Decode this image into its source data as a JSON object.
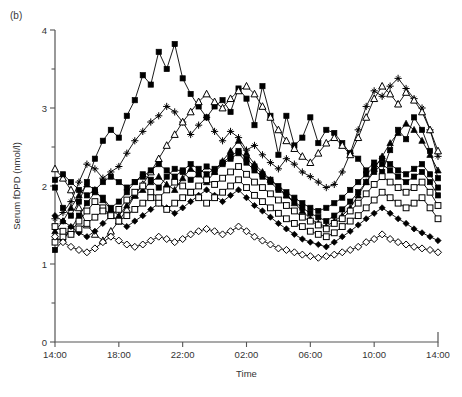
{
  "figure": {
    "panel_label": "(b)",
    "width": 462,
    "height": 397
  },
  "chart_data": {
    "type": "line",
    "title": "",
    "panel": "(b)",
    "xlabel": "Time",
    "ylabel": "Serum fDPD (nmol/l)",
    "ylim": [
      0,
      4
    ],
    "y_major_ticks": [
      0,
      1,
      2,
      3,
      4
    ],
    "y_minor_ticks": [
      0.5,
      1.5,
      2.5,
      3.5
    ],
    "y_tick_labels": [
      "0",
      "1",
      "2",
      "3",
      "4"
    ],
    "xlim_hours": [
      0,
      24
    ],
    "x_tick_labels": [
      "14:00",
      "18:00",
      "22:00",
      "02:00",
      "06:00",
      "10:00",
      "14:00"
    ],
    "x_tick_hours": [
      0,
      4,
      8,
      12,
      16,
      20,
      24
    ],
    "grid": false,
    "legend": "none",
    "x_unit": "clock time over 24 h, samples every 0.5 h",
    "x": [
      0,
      0.5,
      1,
      1.5,
      2,
      2.5,
      3,
      3.5,
      4,
      4.5,
      5,
      5.5,
      6,
      6.5,
      7,
      7.5,
      8,
      8.5,
      9,
      9.5,
      10,
      10.5,
      11,
      11.5,
      12,
      12.5,
      13,
      13.5,
      14,
      14.5,
      15,
      15.5,
      16,
      16.5,
      17,
      17.5,
      18,
      18.5,
      19,
      19.5,
      20,
      20.5,
      21,
      21.5,
      22,
      22.5,
      23,
      23.5,
      24
    ],
    "series": [
      {
        "name": "Subject 1",
        "marker": "filled-square",
        "values": [
          1.98,
          1.72,
          1.62,
          1.8,
          2.05,
          2.35,
          2.58,
          2.72,
          2.62,
          2.9,
          3.1,
          3.42,
          3.3,
          3.72,
          3.5,
          3.82,
          3.38,
          3.18,
          3.02,
          2.88,
          3.02,
          3.1,
          2.95,
          3.25,
          3.12,
          2.78,
          3.28,
          2.9,
          2.4,
          2.9,
          2.52,
          2.62,
          2.88,
          2.55,
          2.72,
          2.68,
          2.55,
          2.42,
          2.35,
          2.2,
          2.3,
          2.18,
          2.46,
          2.72,
          2.6,
          2.88,
          2.72,
          2.45,
          2.1
        ]
      },
      {
        "name": "Subject 2",
        "marker": "plus-star",
        "values": [
          1.58,
          1.66,
          1.8,
          2.05,
          2.28,
          2.22,
          2.1,
          2.18,
          2.25,
          2.42,
          2.58,
          2.7,
          2.82,
          2.9,
          3.02,
          2.95,
          2.82,
          2.66,
          2.78,
          2.88,
          2.7,
          2.58,
          2.7,
          2.62,
          2.46,
          2.52,
          2.4,
          2.3,
          2.22,
          2.35,
          2.28,
          2.18,
          2.12,
          2.05,
          1.98,
          2.02,
          2.18,
          2.42,
          2.72,
          3.02,
          3.22,
          3.15,
          3.28,
          3.38,
          3.25,
          3.12,
          3.0,
          2.72,
          2.38
        ]
      },
      {
        "name": "Subject 3",
        "marker": "open-triangle",
        "values": [
          2.22,
          2.1,
          1.95,
          1.72,
          1.5,
          1.38,
          1.3,
          1.42,
          1.55,
          1.7,
          1.88,
          2.02,
          2.18,
          2.35,
          2.52,
          2.66,
          2.82,
          2.95,
          3.08,
          3.18,
          3.08,
          3.0,
          3.12,
          3.22,
          3.28,
          3.18,
          3.02,
          2.88,
          2.72,
          2.58,
          2.48,
          2.38,
          2.3,
          2.42,
          2.55,
          2.62,
          2.52,
          2.4,
          2.62,
          2.88,
          3.12,
          3.28,
          3.18,
          3.05,
          3.2,
          3.1,
          2.95,
          2.72,
          2.45
        ]
      },
      {
        "name": "Subject 4",
        "marker": "filled-triangle",
        "values": [
          1.42,
          1.55,
          1.72,
          1.88,
          2.02,
          1.95,
          1.82,
          1.7,
          1.62,
          1.75,
          1.88,
          1.95,
          2.05,
          2.12,
          2.02,
          1.95,
          2.1,
          2.22,
          2.15,
          2.05,
          2.18,
          2.32,
          2.45,
          2.58,
          2.42,
          2.28,
          2.18,
          2.08,
          1.98,
          1.88,
          1.78,
          1.68,
          1.58,
          1.52,
          1.48,
          1.55,
          1.62,
          1.72,
          1.88,
          2.05,
          2.22,
          2.38,
          2.55,
          2.68,
          2.8,
          2.72,
          2.58,
          2.4,
          2.2
        ]
      },
      {
        "name": "Subject 5",
        "marker": "filled-square-2",
        "values": [
          1.18,
          1.3,
          1.45,
          1.62,
          1.78,
          1.92,
          1.85,
          1.72,
          1.8,
          1.92,
          2.05,
          2.15,
          2.08,
          1.98,
          2.12,
          2.22,
          2.18,
          2.08,
          2.15,
          2.25,
          2.18,
          2.28,
          2.35,
          2.42,
          2.3,
          2.2,
          2.12,
          2.05,
          1.95,
          1.88,
          1.8,
          1.72,
          1.65,
          1.6,
          1.55,
          1.62,
          1.7,
          1.8,
          1.92,
          2.05,
          2.18,
          2.28,
          2.2,
          2.12,
          2.05,
          2.12,
          2.18,
          2.05,
          1.88
        ]
      },
      {
        "name": "Subject 6",
        "marker": "open-square",
        "values": [
          1.28,
          1.35,
          1.42,
          1.55,
          1.68,
          1.8,
          1.72,
          1.62,
          1.7,
          1.82,
          1.92,
          2.0,
          1.92,
          1.85,
          1.95,
          2.05,
          2.0,
          1.92,
          2.0,
          2.08,
          2.02,
          2.1,
          2.18,
          2.25,
          2.15,
          2.05,
          1.98,
          1.9,
          1.82,
          1.75,
          1.68,
          1.6,
          1.55,
          1.5,
          1.45,
          1.52,
          1.58,
          1.68,
          1.78,
          1.9,
          2.02,
          2.12,
          2.05,
          1.98,
          1.92,
          1.98,
          2.05,
          1.92,
          1.75
        ]
      },
      {
        "name": "Subject 7",
        "marker": "filled-diamond",
        "values": [
          1.62,
          1.55,
          1.48,
          1.4,
          1.35,
          1.42,
          1.52,
          1.62,
          1.55,
          1.48,
          1.55,
          1.62,
          1.7,
          1.78,
          1.72,
          1.65,
          1.72,
          1.8,
          1.88,
          1.95,
          1.88,
          1.8,
          1.88,
          1.95,
          1.85,
          1.75,
          1.68,
          1.6,
          1.52,
          1.45,
          1.38,
          1.32,
          1.28,
          1.25,
          1.22,
          1.28,
          1.35,
          1.42,
          1.5,
          1.58,
          1.65,
          1.72,
          1.65,
          1.58,
          1.52,
          1.45,
          1.4,
          1.35,
          1.3
        ]
      },
      {
        "name": "Subject 8",
        "marker": "open-diamond",
        "values": [
          1.35,
          1.28,
          1.22,
          1.18,
          1.15,
          1.2,
          1.28,
          1.35,
          1.3,
          1.25,
          1.22,
          1.25,
          1.3,
          1.35,
          1.32,
          1.28,
          1.32,
          1.38,
          1.42,
          1.45,
          1.42,
          1.38,
          1.42,
          1.48,
          1.42,
          1.35,
          1.3,
          1.25,
          1.2,
          1.18,
          1.15,
          1.12,
          1.1,
          1.08,
          1.1,
          1.12,
          1.15,
          1.18,
          1.22,
          1.28,
          1.32,
          1.38,
          1.32,
          1.28,
          1.25,
          1.22,
          1.2,
          1.18,
          1.15
        ]
      },
      {
        "name": "Subject 9",
        "marker": "open-square-2",
        "values": [
          1.48,
          1.42,
          1.38,
          1.45,
          1.52,
          1.6,
          1.68,
          1.62,
          1.55,
          1.62,
          1.7,
          1.78,
          1.85,
          1.78,
          1.7,
          1.78,
          1.85,
          1.92,
          1.85,
          1.78,
          1.85,
          1.92,
          2.0,
          2.08,
          1.98,
          1.88,
          1.8,
          1.72,
          1.65,
          1.58,
          1.52,
          1.48,
          1.42,
          1.38,
          1.35,
          1.4,
          1.48,
          1.55,
          1.62,
          1.72,
          1.82,
          1.92,
          1.85,
          1.78,
          1.72,
          1.78,
          1.85,
          1.72,
          1.58
        ]
      },
      {
        "name": "Subject 10",
        "marker": "filled-square-3",
        "values": [
          2.08,
          2.15,
          2.05,
          1.95,
          1.88,
          1.95,
          2.05,
          2.12,
          2.05,
          1.98,
          2.05,
          2.12,
          2.2,
          2.28,
          2.2,
          2.12,
          2.2,
          2.28,
          2.22,
          2.15,
          2.22,
          2.3,
          2.38,
          2.45,
          2.35,
          2.25,
          2.15,
          2.08,
          2.0,
          1.92,
          1.85,
          1.78,
          1.72,
          1.68,
          1.72,
          1.78,
          1.85,
          1.95,
          2.05,
          2.15,
          2.25,
          2.35,
          2.28,
          2.2,
          2.15,
          2.22,
          2.28,
          2.15,
          1.98
        ]
      }
    ]
  }
}
